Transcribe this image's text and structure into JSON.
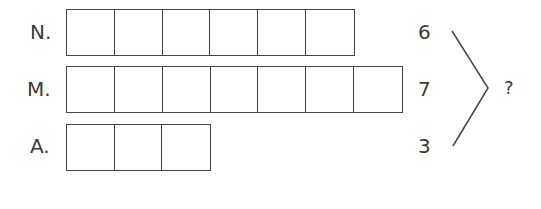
{
  "rows": [
    {
      "label": "N.",
      "count": 6,
      "value": "6"
    },
    {
      "label": "M.",
      "count": 7,
      "value": "7"
    },
    {
      "label": "A.",
      "count": 3,
      "value": "3"
    }
  ],
  "result": "?"
}
